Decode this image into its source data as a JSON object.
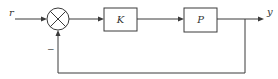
{
  "diagram": {
    "type": "feedback-control-loop",
    "input_label": "r",
    "output_label": "y",
    "summing_junction": {
      "feedback_sign": "−"
    },
    "blocks": [
      {
        "id": "controller",
        "label": "K"
      },
      {
        "id": "plant",
        "label": "P"
      }
    ],
    "connections": [
      {
        "from": "r",
        "to": "summing_junction"
      },
      {
        "from": "summing_junction",
        "to": "controller"
      },
      {
        "from": "controller",
        "to": "plant"
      },
      {
        "from": "plant",
        "to": "y"
      },
      {
        "from": "y",
        "to": "summing_junction",
        "type": "negative-feedback"
      }
    ]
  }
}
